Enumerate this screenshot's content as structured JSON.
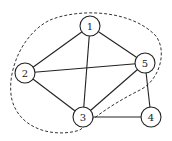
{
  "graph": {
    "nodes": [
      {
        "id": "1",
        "label": "1"
      },
      {
        "id": "2",
        "label": "2"
      },
      {
        "id": "3",
        "label": "3"
      },
      {
        "id": "4",
        "label": "4"
      },
      {
        "id": "5",
        "label": "5"
      }
    ],
    "edges": [
      [
        "1",
        "2"
      ],
      [
        "1",
        "3"
      ],
      [
        "1",
        "5"
      ],
      [
        "2",
        "5"
      ],
      [
        "2",
        "3"
      ],
      [
        "3",
        "5"
      ],
      [
        "3",
        "4"
      ],
      [
        "4",
        "5"
      ]
    ],
    "dashed_region_contains": [
      "1",
      "2",
      "3",
      "5"
    ]
  }
}
